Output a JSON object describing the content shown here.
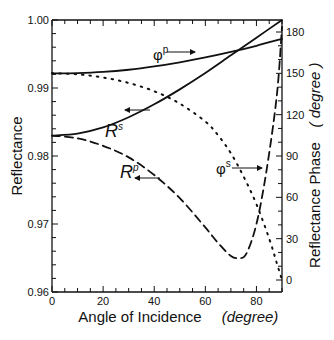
{
  "chart_data": {
    "type": "line",
    "title": "",
    "xlabel": "Angle of Incidence",
    "xlabel_unit": "(degree)",
    "ylabel": "Reflectance",
    "y2label": "Reflectance Phase",
    "y2label_unit": "( degree )",
    "xlim": [
      0,
      90
    ],
    "ylim": [
      0.96,
      1.0
    ],
    "y2lim": [
      -7,
      185
    ],
    "x_ticks": [
      0,
      20,
      40,
      60,
      80
    ],
    "x_tick_labels": [
      "0",
      "20",
      "40",
      "60",
      "80"
    ],
    "y_ticks": [
      0.96,
      0.97,
      0.98,
      0.99,
      1.0
    ],
    "y_tick_labels": [
      "0.96",
      "0.97",
      "0.98",
      "0.99",
      "1.00"
    ],
    "y2_ticks": [
      0,
      30,
      60,
      90,
      120,
      150,
      180
    ],
    "y2_tick_labels": [
      "0",
      "30",
      "60",
      "90",
      "120",
      "150",
      "180"
    ],
    "grid": false,
    "legend": "inline labels with arrows pointing to respective axis",
    "series": [
      {
        "name": "R^s",
        "label": "R",
        "superscript": "s",
        "axis": "left",
        "style": "solid",
        "x": [
          0,
          10,
          20,
          30,
          40,
          50,
          60,
          70,
          80,
          90
        ],
        "y": [
          0.983,
          0.9833,
          0.9842,
          0.9857,
          0.9876,
          0.9898,
          0.9922,
          0.9948,
          0.9974,
          1.0
        ]
      },
      {
        "name": "R^p",
        "label": "R",
        "superscript": "p",
        "axis": "left",
        "style": "dashed",
        "x": [
          0,
          10,
          20,
          30,
          40,
          50,
          60,
          65,
          70,
          73,
          76,
          80,
          84,
          88,
          90
        ],
        "y": [
          0.983,
          0.9826,
          0.9815,
          0.9798,
          0.9772,
          0.9738,
          0.9695,
          0.9672,
          0.9653,
          0.965,
          0.9656,
          0.97,
          0.978,
          0.989,
          0.999
        ]
      },
      {
        "name": "phi^p",
        "label": "φ",
        "superscript": "p",
        "axis": "right",
        "style": "solid",
        "x": [
          0,
          10,
          20,
          30,
          40,
          50,
          60,
          70,
          80,
          90
        ],
        "y": [
          150.0,
          150.2,
          151.0,
          152.6,
          155.0,
          158.0,
          161.5,
          165.5,
          170.0,
          175.0
        ]
      },
      {
        "name": "phi^s",
        "label": "φ",
        "superscript": "s",
        "axis": "right",
        "style": "dotted",
        "x": [
          0,
          10,
          20,
          30,
          40,
          50,
          60,
          65,
          70,
          75,
          80,
          85,
          88,
          90
        ],
        "y": [
          150.0,
          149.3,
          147.0,
          143.0,
          137.0,
          128.0,
          115.0,
          105.0,
          92.0,
          75.0,
          55.0,
          30.0,
          12.0,
          0.0
        ]
      }
    ],
    "annotations": [
      {
        "text": "φ",
        "sup": "p",
        "arrow": "right"
      },
      {
        "text": "R",
        "sup": "s",
        "arrow": "left"
      },
      {
        "text": "R",
        "sup": "p",
        "arrow": "left"
      },
      {
        "text": "φ",
        "sup": "s",
        "arrow": "right"
      }
    ]
  }
}
